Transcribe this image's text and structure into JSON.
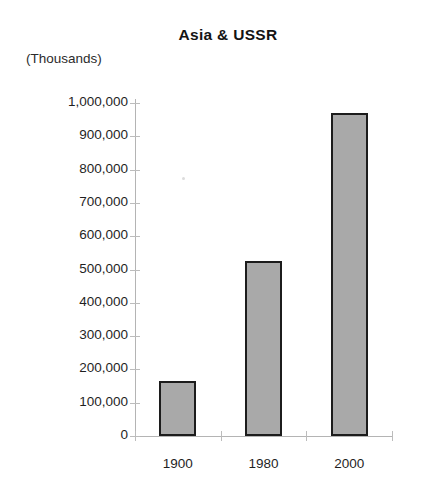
{
  "chart_data": {
    "type": "bar",
    "title": "Asia & USSR",
    "unit_label": "(Thousands)",
    "xlabel": "",
    "ylabel": "",
    "categories": [
      "1900",
      "1980",
      "2000"
    ],
    "values": [
      165000,
      525000,
      970000
    ],
    "ylim": [
      0,
      1000000
    ],
    "ytick_labels": [
      "1,000,000",
      "900,000",
      "800,000",
      "700,000",
      "600,000",
      "500,000",
      "400,000",
      "300,000",
      "200,000",
      "100,000",
      "0"
    ],
    "ytick_values": [
      1000000,
      900000,
      800000,
      700000,
      600000,
      500000,
      400000,
      300000,
      200000,
      100000,
      0
    ],
    "grid": false,
    "legend": false,
    "series": [
      {
        "name": "Asia & USSR",
        "values": [
          165000,
          525000,
          970000
        ]
      }
    ],
    "colors": {
      "bar_fill": "#a9a9a9",
      "bar_border": "#1c1c1c",
      "axis": "#b4b4b4",
      "text": "#1f1f1f",
      "background": "#ffffff"
    }
  }
}
